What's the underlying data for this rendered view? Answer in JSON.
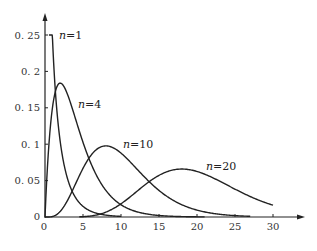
{
  "chart_data": {
    "type": "line",
    "title": "",
    "xlabel": "",
    "ylabel": "",
    "xlim": [
      0,
      30
    ],
    "ylim": [
      0,
      0.25
    ],
    "grid": false,
    "legend": "inline curve labels",
    "x_ticks": [
      "0",
      "5",
      "10",
      "15",
      "20",
      "25",
      "30"
    ],
    "y_ticks": [
      "0",
      "0.05",
      "0.1",
      "0.15",
      "0.2",
      "0.25"
    ],
    "y_tick_labels_display": [
      "0",
      "0. 05",
      "0. 1",
      "0. 15",
      "0. 2",
      "0. 25"
    ],
    "series": [
      {
        "name": "n=1",
        "dof": 1,
        "x": [
          0.5,
          1,
          2,
          3,
          5,
          8,
          10
        ],
        "values": [
          0.25,
          0.24,
          0.1,
          0.05,
          0.015,
          0.003,
          0.001
        ]
      },
      {
        "name": "n=4",
        "dof": 4,
        "x": [
          0,
          1,
          2,
          3,
          5,
          8,
          10,
          15,
          20
        ],
        "values": [
          0,
          0.152,
          0.184,
          0.167,
          0.103,
          0.037,
          0.017,
          0.002,
          0.0002
        ]
      },
      {
        "name": "n=10",
        "dof": 10,
        "x": [
          0,
          2,
          4,
          6,
          8,
          10,
          12,
          15,
          20,
          25
        ],
        "values": [
          0,
          0.008,
          0.045,
          0.085,
          0.098,
          0.088,
          0.067,
          0.035,
          0.008,
          0.001
        ]
      },
      {
        "name": "n=20",
        "dof": 20,
        "x": [
          5,
          10,
          14,
          18,
          22,
          26,
          30
        ],
        "values": [
          0.0003,
          0.009,
          0.041,
          0.066,
          0.062,
          0.042,
          0.025
        ]
      }
    ],
    "annotations": [
      {
        "text_var": "n",
        "text_rest": "=1",
        "x": 1.5,
        "y": 0.25
      },
      {
        "text_var": "n",
        "text_rest": "=4",
        "x": 6.3,
        "y": 0.154
      },
      {
        "text_var": "n",
        "text_rest": "=10",
        "x": 10.3,
        "y": 0.1
      },
      {
        "text_var": "n",
        "text_rest": "=20",
        "x": 20.8,
        "y": 0.074
      }
    ]
  },
  "labels": {
    "n1_var": "n",
    "n1_rest": "=1",
    "n4_var": "n",
    "n4_rest": "=4",
    "n10_var": "n",
    "n10_rest": "=10",
    "n20_var": "n",
    "n20_rest": "=20"
  },
  "ticks": {
    "x0": "0",
    "x5": "5",
    "x10": "10",
    "x15": "15",
    "x20": "20",
    "x25": "25",
    "x30": "30",
    "y0": "0",
    "y005": "0. 05",
    "y01": "0. 1",
    "y015": "0. 15",
    "y02": "0. 2",
    "y025": "0. 25"
  }
}
